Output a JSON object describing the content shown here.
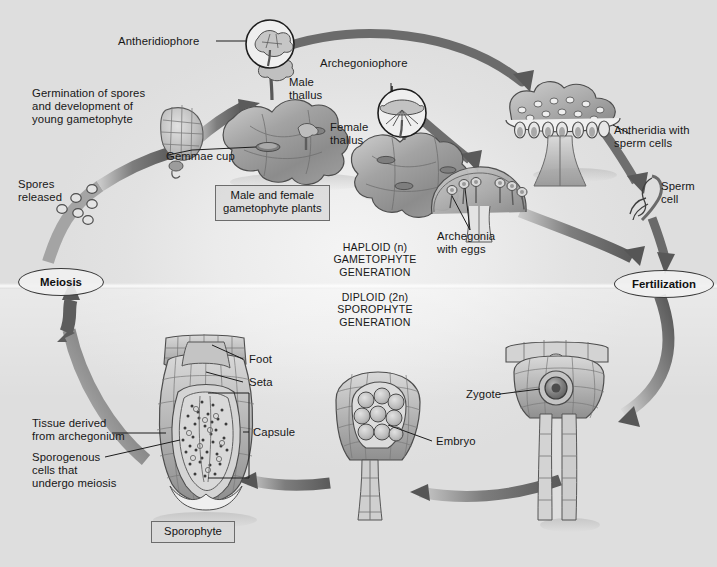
{
  "figure": {
    "type": "biological-life-cycle-diagram",
    "canvas": {
      "width": 717,
      "height": 567
    },
    "palette": {
      "background": "#e8e8e8",
      "arrow_dark": "#5d5d5d",
      "arrow_mid": "#8a8a8a",
      "arrow_light": "#bdbdbd",
      "tissue_fill": "#b2b2b2",
      "tissue_dark": "#8d8d8d",
      "tissue_light": "#d8d8d8",
      "outline": "#4a4a4a",
      "text": "#171717",
      "box_border": "#6c6c6c",
      "box_fill": "#d8d8d8"
    }
  },
  "phase_labels": {
    "haploid": "HAPLOID (n)\nGAMETOPHYTE\nGENERATION",
    "diploid": "DIPLOID (2n)\nSPOROPHYTE\nGENERATION"
  },
  "stage_nodes": {
    "meiosis": "Meiosis",
    "fertilization": "Fertilization"
  },
  "boxed_labels": {
    "gametophyte_plants": "Male and female\ngametophyte plants",
    "sporophyte": "Sporophyte"
  },
  "callouts": [
    {
      "id": "antheridiophore",
      "text": "Antheridiophore"
    },
    {
      "id": "archegoniophore",
      "text": "Archegoniophore"
    },
    {
      "id": "germination",
      "text": "Germination of spores\nand development of\nyoung gametophyte"
    },
    {
      "id": "spores-released",
      "text": "Spores\nreleased"
    },
    {
      "id": "gemmae-cup",
      "text": "Gemmae cup"
    },
    {
      "id": "male-thallus",
      "text": "Male\nthallus"
    },
    {
      "id": "female-thallus",
      "text": "Female\nthallus"
    },
    {
      "id": "antheridia",
      "text": "Antheridia with\nsperm cells"
    },
    {
      "id": "sperm-cell",
      "text": "Sperm\ncell"
    },
    {
      "id": "archegonia",
      "text": "Archegonia\nwith eggs"
    },
    {
      "id": "zygote",
      "text": "Zygote"
    },
    {
      "id": "embryo",
      "text": "Embryo"
    },
    {
      "id": "foot",
      "text": "Foot"
    },
    {
      "id": "seta",
      "text": "Seta"
    },
    {
      "id": "capsule",
      "text": "Capsule"
    },
    {
      "id": "tissue-from-archegonium",
      "text": "Tissue derived\nfrom archegonium"
    },
    {
      "id": "sporogenous-cells",
      "text": "Sporogenous\ncells that\nundergo meiosis"
    }
  ],
  "cycle_sequence": [
    "Meiosis",
    "Spores released",
    "Germination of spores and development of young gametophyte",
    "Male and female gametophyte plants",
    "Antheridia with sperm cells / Archegonia with eggs",
    "Sperm cell",
    "Fertilization",
    "Zygote",
    "Embryo",
    "Sporophyte"
  ]
}
